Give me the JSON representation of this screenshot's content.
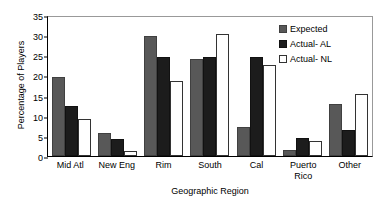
{
  "chart_data": {
    "type": "bar",
    "title": "",
    "xlabel": "Geographic Region",
    "ylabel": "Percentage of Players",
    "ylim": [
      0,
      35
    ],
    "ytick_step": 5,
    "yticks": [
      0,
      5,
      10,
      15,
      20,
      25,
      30,
      35
    ],
    "ytick_labels": [
      "0",
      "5",
      "10",
      "15",
      "20",
      "25",
      "30",
      "35"
    ],
    "grid": false,
    "legend_position": "top-right",
    "categories": [
      "Mid Atl",
      "New Eng",
      "Rim",
      "South",
      "Cal",
      "Puerto Rico",
      "Other"
    ],
    "category_lines": [
      [
        "Mid Atl"
      ],
      [
        "New Eng"
      ],
      [
        "Rim"
      ],
      [
        "South"
      ],
      [
        "Cal"
      ],
      [
        "Puerto",
        "Rico"
      ],
      [
        "Other"
      ]
    ],
    "series": [
      {
        "name": "Expected",
        "key": "expected",
        "color": "#585858",
        "values": [
          19.6,
          5.8,
          29.9,
          24.1,
          7.1,
          1.5,
          13.0
        ]
      },
      {
        "name": "Actual- AL",
        "key": "actual-al",
        "color": "#1c1c1c",
        "values": [
          12.3,
          4.3,
          24.5,
          24.5,
          24.6,
          4.5,
          6.4
        ]
      },
      {
        "name": "Actual- NL",
        "key": "actual-nl",
        "color": "#ffffff",
        "values": [
          9.3,
          1.2,
          18.7,
          30.4,
          22.5,
          3.7,
          15.4
        ]
      }
    ]
  },
  "legend": {
    "items": [
      {
        "label": "Expected",
        "key": "expected"
      },
      {
        "label": "Actual- AL",
        "key": "actual-al"
      },
      {
        "label": "Actual- NL",
        "key": "actual-nl"
      }
    ]
  }
}
